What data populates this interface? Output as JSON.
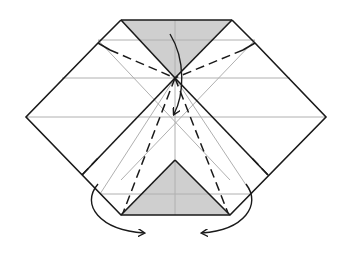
{
  "diagram": {
    "type": "origami-folding-step",
    "colors": {
      "background": "#ffffff",
      "paper_outline": "#1a1a1a",
      "reference_lines": "#b0b0b0",
      "shaded_face": "#cfcfcf",
      "fold_lines": "#1a1a1a",
      "arrows": "#1a1a1a"
    },
    "elements": {
      "outline": "hexagonal paper outline",
      "top_flap": "shaded top triangle",
      "bottom_flap": "shaded bottom triangle",
      "valley_folds": "dashed valley fold lines",
      "arrows": [
        "fold-down arrow",
        "left fold-under arrow",
        "right fold-under arrow"
      ]
    }
  }
}
